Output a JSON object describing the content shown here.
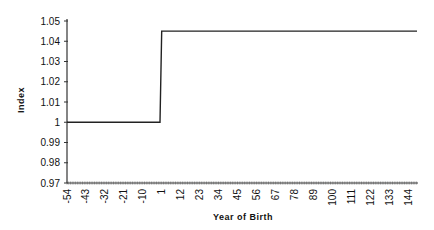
{
  "chart_data": {
    "type": "line",
    "title": "",
    "xlabel": "Year of Birth",
    "ylabel": "Index",
    "xlim": [
      -54,
      150
    ],
    "ylim": [
      0.97,
      1.05
    ],
    "y_ticks": [
      "0.97",
      "0.98",
      "0.99",
      "1",
      "1.01",
      "1.02",
      "1.03",
      "1.04",
      "1.05"
    ],
    "x_ticks": [
      "-54",
      "-43",
      "-32",
      "-21",
      "-10",
      "1",
      "12",
      "23",
      "34",
      "45",
      "56",
      "67",
      "78",
      "89",
      "100",
      "111",
      "122",
      "133",
      "144"
    ],
    "grid": false,
    "legend": null,
    "series": [
      {
        "name": "Index",
        "x": [
          -54,
          0,
          1,
          150
        ],
        "y": [
          1.0,
          1.0,
          1.045,
          1.045
        ],
        "color": "#222222"
      }
    ]
  }
}
